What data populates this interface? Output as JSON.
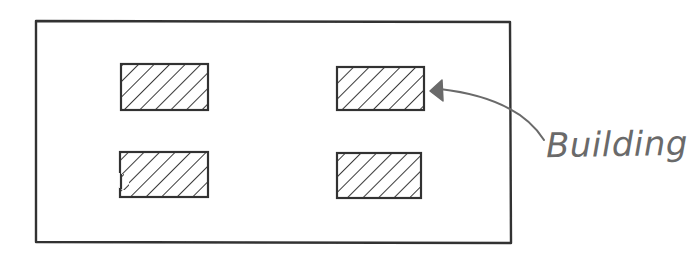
{
  "diagram": {
    "title": "",
    "style": "hand-drawn sketch",
    "colors": {
      "background": "#ffffff",
      "stroke": "#333333",
      "hatch": "#3a3a3a",
      "annotation": "#6a6a6a"
    },
    "site": {
      "name": "site-boundary",
      "x": 36,
      "y": 21,
      "width": 474,
      "height": 222
    },
    "buildings": [
      {
        "id": "building-1",
        "x": 121,
        "y": 64,
        "width": 87,
        "height": 46
      },
      {
        "id": "building-2",
        "x": 337,
        "y": 67,
        "width": 87,
        "height": 43
      },
      {
        "id": "building-3",
        "x": 120,
        "y": 152,
        "width": 88,
        "height": 45
      },
      {
        "id": "building-4",
        "x": 337,
        "y": 153,
        "width": 84,
        "height": 45
      }
    ],
    "annotation": {
      "label": "Building",
      "points_to": "building-2",
      "label_x": 546,
      "label_y": 124
    }
  }
}
